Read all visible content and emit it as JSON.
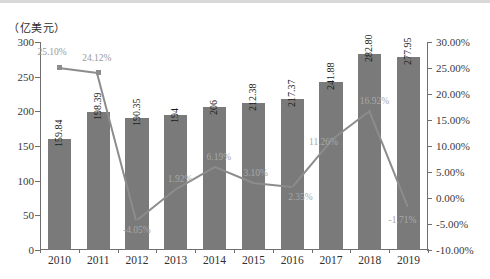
{
  "axis": {
    "unit_label": "（亿美元）",
    "left_ticks": [
      "300",
      "250",
      "200",
      "150",
      "100",
      "50",
      "0"
    ],
    "right_ticks": [
      "30.00%",
      "25.00%",
      "20.00%",
      "15.00%",
      "10.00%",
      "5.00%",
      "0.00%",
      "-5.00%",
      "-10.00%"
    ]
  },
  "chart_data": {
    "type": "bar",
    "title": "",
    "subtitle": "",
    "xlabel": "",
    "ylabel": "（亿美元）",
    "y2label": "",
    "grid": false,
    "legend": "none",
    "ylim": [
      0,
      300
    ],
    "y2lim": [
      -10,
      30
    ],
    "categories": [
      "2010",
      "2011",
      "2012",
      "2013",
      "2014",
      "2015",
      "2016",
      "2017",
      "2018",
      "2019"
    ],
    "series": [
      {
        "name": "金额",
        "type": "bar",
        "axis": "left",
        "values": [
          159.84,
          198.39,
          190.35,
          194,
          206,
          212.38,
          217.37,
          241.88,
          282.8,
          277.95
        ],
        "labels": [
          "159.84",
          "198.39",
          "190.35",
          "194",
          "206",
          "212.38",
          "217.37",
          "241.88",
          "282.80",
          "277.95"
        ]
      },
      {
        "name": "增长率",
        "type": "line",
        "axis": "right",
        "values": [
          25.1,
          24.12,
          -4.05,
          1.92,
          6.19,
          3.1,
          2.35,
          11.26,
          16.92,
          -1.71
        ],
        "labels": [
          "25.10%",
          "24.12%",
          "-4.05%",
          "1.92%",
          "6.19%",
          "3.10%",
          "2.35%",
          "11.26%",
          "16.92%",
          "-1.71%"
        ]
      }
    ]
  },
  "colors": {
    "bar": "#7a7a7a",
    "line": "#8c8c8c",
    "axis": "#6f6f6f",
    "label": "#9a9a9a"
  }
}
